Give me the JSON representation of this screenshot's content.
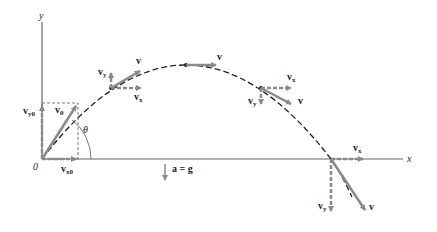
{
  "diagram": {
    "axes": {
      "x_label": "x",
      "y_label": "y",
      "origin_label": "0",
      "angle_label": "θ"
    },
    "acceleration_label": "a = g",
    "labels": {
      "v": "v",
      "vx": "v",
      "vx_sub": "x",
      "vy": "v",
      "vy_sub": "y",
      "v0": "v",
      "v0_sub": "0",
      "vx0": "v",
      "vx0_sub": "x0",
      "vy0": "v",
      "vy0_sub": "y0"
    },
    "points": [
      {
        "name": "launch",
        "x": 42,
        "y": 159
      },
      {
        "name": "rising",
        "x": 111,
        "y": 88
      },
      {
        "name": "apex",
        "x": 186,
        "y": 65
      },
      {
        "name": "descending",
        "x": 261,
        "y": 88
      },
      {
        "name": "landing",
        "x": 331,
        "y": 159
      }
    ],
    "colors": {
      "axis": "#555555",
      "trajectory": "#222222",
      "vector": "#8a8a8a",
      "text": "#222222"
    }
  }
}
